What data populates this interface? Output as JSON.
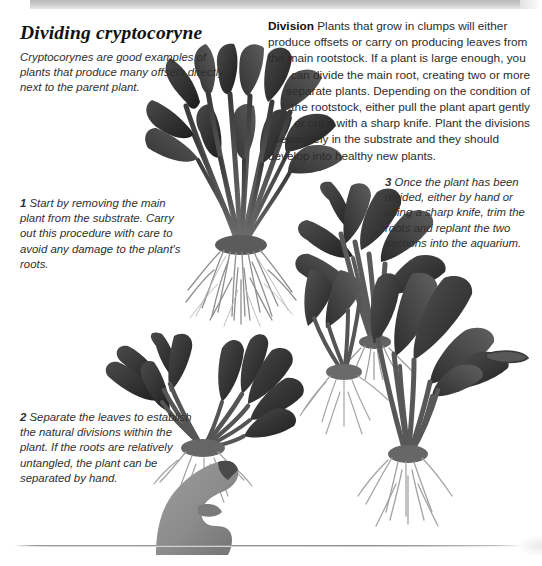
{
  "page": {
    "title": "Dividing cryptocoryne",
    "background_color": "#ffffff",
    "top_band_color": "#c2c2c2",
    "rule_color": "#8f8f8f"
  },
  "intro_caption": {
    "text": "Cryptocorynes are good examples of plants that produce many offsets directly next to the parent plant."
  },
  "body": {
    "lead": "Division",
    "text": "Plants that grow in clumps will either produce offsets or carry on producing leaves from the main rootstock. If a plant is large enough, you can divide the main root, creating two or more separate plants. Depending on the condition of the rootstock, either pull the plant apart gently or cut it with a sharp knife. Plant the divisions separately in the substrate and they should develop into healthy new plants.",
    "lines": [
      "Plants that grow in clumps will either",
      "produce offsets or carry on producing leaves from",
      "the main rootstock. If a plant is large enough, you",
      "can divide the main root, creating two or more",
      "separate plants. Depending on the condition of",
      "the rootstock, either pull the plant apart gently",
      "or cut it with a sharp knife. Plant the divisions",
      "separately in the substrate and they should",
      "develop into healthy new plants."
    ]
  },
  "steps": [
    {
      "number": "1",
      "text": "Start by removing the main plant from the substrate. Carry out this procedure with care to avoid any damage to the plant's roots."
    },
    {
      "number": "2",
      "text": "Separate the leaves to establish the natural divisions within the plant. If the roots are relatively untangled, the plant can be separated by hand."
    },
    {
      "number": "3",
      "text": "Once the plant has been divided, either by hand or using a sharp knife, trim the roots and replant the two sections into the aquarium."
    }
  ],
  "images": [
    {
      "name": "whole-cryptocoryne-plant-with-roots",
      "alt": "Large cryptocoryne clump with exposed root mass"
    },
    {
      "name": "divided-plant-section-upper-right",
      "alt": "Separated cryptocoryne section with leaves"
    },
    {
      "name": "hand-holding-divided-plant",
      "alt": "Hand holding a cryptocoryne plant being pulled apart"
    },
    {
      "name": "two-replanted-divisions-with-roots",
      "alt": "Two divided cryptocoryne plants with trimmed roots"
    }
  ]
}
